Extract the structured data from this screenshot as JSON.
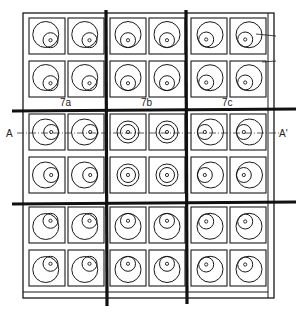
{
  "figure": {
    "type": "technical-drawing",
    "ink_color": "#1a1a1a",
    "background": "#ffffff"
  },
  "labels": {
    "section_start": "A",
    "section_end": "A'",
    "block_labels": [
      "7a",
      "7b",
      "7c"
    ]
  },
  "grid": {
    "rows": 6,
    "cols": 6,
    "block_rows": 3,
    "block_cols": 3,
    "cells": [
      [
        "eccentric-lower-right",
        "eccentric-lower-right",
        "eccentric-lower",
        "eccentric-lower",
        "eccentric-lower-left",
        "eccentric-lower-left"
      ],
      [
        "eccentric-lower-right",
        "eccentric-lower-right",
        "eccentric-lower",
        "eccentric-lower",
        "eccentric-lower-left",
        "eccentric-lower-left"
      ],
      [
        "eccentric-right",
        "eccentric-right",
        "concentric",
        "concentric",
        "eccentric-left",
        "eccentric-left"
      ],
      [
        "eccentric-right",
        "eccentric-right",
        "concentric",
        "concentric",
        "eccentric-left",
        "eccentric-left"
      ],
      [
        "eccentric-upper-right",
        "eccentric-upper-right",
        "eccentric-upper",
        "eccentric-upper",
        "eccentric-upper-left",
        "eccentric-upper-left"
      ],
      [
        "eccentric-upper-right",
        "eccentric-upper-right",
        "eccentric-upper",
        "eccentric-upper",
        "eccentric-upper-left",
        "eccentric-upper-left"
      ]
    ]
  }
}
